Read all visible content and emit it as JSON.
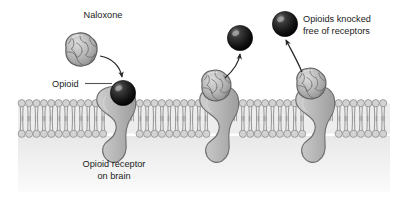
{
  "figure": {
    "title_alt": "Naloxone displacing opioids from opioid receptors on brain cells",
    "width": 407,
    "height": 205,
    "background_color": "#ffffff"
  },
  "labels": {
    "naloxone": "Naloxone",
    "opioid": "Opioid",
    "receptor_line1": "Opioid receptor",
    "receptor_line2": "on brain",
    "knocked_line1": "Opioids knocked",
    "knocked_line2": "free of receptors"
  },
  "colors": {
    "membrane_head": "#d3d3d3",
    "membrane_head_stroke": "#8e8e8e",
    "membrane_tail": "#9a9a9a",
    "membrane_band": "#ededed",
    "receptor_fill": "#b4b4b4",
    "receptor_stroke": "#6f6f6f",
    "naloxone_fill": "#b8b8b8",
    "naloxone_stroke": "#5e5e5e",
    "opioid_fill": "#141414",
    "opioid_highlight": "#8c8c8c",
    "cytoplasm": "#efefef",
    "text": "#1b1b1b",
    "arrow": "#262626",
    "leader": "#555555"
  },
  "membrane": {
    "top_y": 100,
    "bottom_y": 137,
    "left_x": 18,
    "right_x": 390,
    "head_radius": 3.6,
    "head_spacing": 7.4
  },
  "receptors": [
    {
      "name": "receptor-left",
      "x": 112,
      "ligand": "opioid",
      "ligand_bound": true
    },
    {
      "name": "receptor-middle",
      "x": 215,
      "ligand": "naloxone",
      "ligand_bound": true
    },
    {
      "name": "receptor-right",
      "x": 310,
      "ligand": "naloxone",
      "ligand_bound": true
    }
  ],
  "ligands": {
    "free_naloxone": {
      "cx": 81,
      "cy": 50,
      "r": 17
    },
    "bound_opioid": {
      "cx": 123,
      "cy": 94,
      "r": 12.5
    },
    "free_opioid_middle": {
      "cx": 240,
      "cy": 38,
      "r": 12.5
    },
    "free_opioid_right": {
      "cx": 285,
      "cy": 24,
      "r": 12.5
    }
  },
  "arrows": [
    {
      "name": "arrow-naloxone-to-receptor",
      "direction": "down-right"
    },
    {
      "name": "arrow-opioid-released-middle",
      "direction": "up-right"
    },
    {
      "name": "arrow-opioid-released-right",
      "direction": "up-right"
    }
  ]
}
